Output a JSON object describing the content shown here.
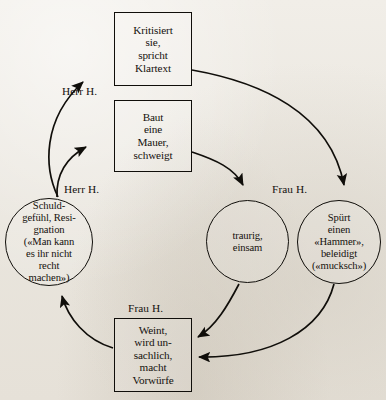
{
  "diagram": {
    "background_color": "#e9e5dd",
    "ink_color": "#100e0a",
    "nodes": [
      {
        "id": "kritisiert",
        "shape": "box",
        "text": "Kritisiert\nsie,\nspricht\nKlartext"
      },
      {
        "id": "mauer",
        "shape": "box",
        "text": "Baut\neine\nMauer,\nschweigt"
      },
      {
        "id": "schuldgefuehl",
        "shape": "circle",
        "text": "Schuld-\ngefühl, Resi-\ngnation\n(«Man kann\nes ihr nicht\nrecht\nmachen»)"
      },
      {
        "id": "traurig",
        "shape": "circle",
        "text": "traurig,\neinsam"
      },
      {
        "id": "hammer",
        "shape": "circle",
        "text": "Spürt\neinen\n«Hammer»,\nbeleidigt\n(«mucksch»)"
      },
      {
        "id": "weint",
        "shape": "box",
        "text": "Weint,\nwird un-\nsachlich,\nmacht\nVorwürfe"
      }
    ],
    "actor_labels": [
      {
        "id": "herr-h-top",
        "text": "Herr H."
      },
      {
        "id": "herr-h-left",
        "text": "Herr H."
      },
      {
        "id": "frau-h-right",
        "text": "Frau H."
      },
      {
        "id": "frau-h-bottom",
        "text": "Frau H."
      }
    ]
  }
}
